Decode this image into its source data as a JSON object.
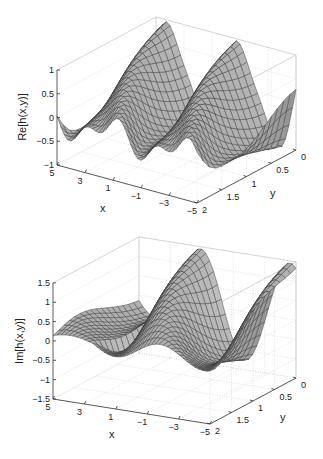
{
  "chart_data": [
    {
      "type": "surface",
      "title": "",
      "xlabel": "x",
      "ylabel": "y",
      "zlabel": "Re[h(x,y)]",
      "xlim": [
        -5,
        5
      ],
      "ylim": [
        0,
        2
      ],
      "zlim": [
        -1,
        1
      ],
      "x_ticks": [
        "5",
        "3",
        "1",
        "-1",
        "-3",
        "-5"
      ],
      "y_ticks": [
        "0",
        "0.5",
        "1",
        "1.5",
        "2"
      ],
      "z_ticks": [
        "1",
        "0.5",
        "0",
        "-0.5",
        "-1"
      ],
      "grid": true,
      "surface_color": "#a8a8a8",
      "mesh_color": "#333333",
      "description": "Oscillating ridges along x; peaks near x=4, x=-1 and x=-5 at y=0, values roughly between -0.6 and 1"
    },
    {
      "type": "surface",
      "title": "",
      "xlabel": "x",
      "ylabel": "y",
      "zlabel": "Im[h(x,y)]",
      "xlim": [
        -5,
        5
      ],
      "ylim": [
        0,
        2
      ],
      "zlim": [
        -1.5,
        1.5
      ],
      "x_ticks": [
        "5",
        "3",
        "1",
        "-1",
        "-3",
        "-5"
      ],
      "y_ticks": [
        "0",
        "0.5",
        "1",
        "1.5",
        "2"
      ],
      "z_ticks": [
        "1.5",
        "1",
        "0.5",
        "0",
        "-0.5",
        "-1",
        "-1.5"
      ],
      "grid": true,
      "surface_color": "#a8a8a8",
      "mesh_color": "#333333",
      "description": "Oscillating surface; ridges near x=1 and x=-4 at y=0 reaching ~1.5, troughs ~-0.8"
    }
  ],
  "plots": [
    {
      "zlabel": "Re[h(x,y)]",
      "xlabel": "x",
      "ylabel": "y",
      "z_ticks": [
        "1",
        "0.5",
        "0",
        "−0.5",
        "−1"
      ],
      "x_ticks": [
        "5",
        "3",
        "1",
        "−1",
        "−3",
        "−5"
      ],
      "y_ticks": [
        "0",
        "0.5",
        "1",
        "1.5",
        "2"
      ]
    },
    {
      "zlabel": "Im[h(x,y)]",
      "xlabel": "x",
      "ylabel": "y",
      "z_ticks": [
        "1.5",
        "1",
        "0.5",
        "0",
        "−0.5",
        "−1",
        "−1.5"
      ],
      "x_ticks": [
        "5",
        "3",
        "1",
        "−1",
        "−3",
        "−5"
      ],
      "y_ticks": [
        "0",
        "0.5",
        "1",
        "1.5",
        "2"
      ]
    }
  ]
}
